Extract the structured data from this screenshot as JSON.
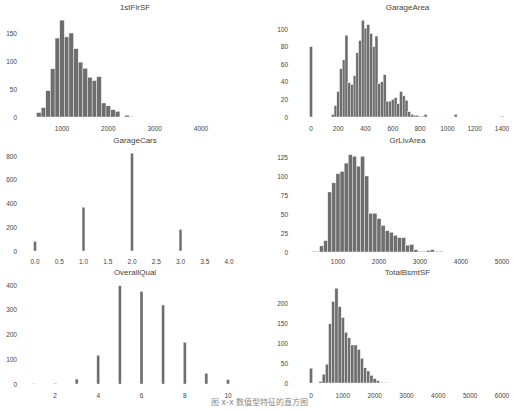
{
  "figure": {
    "caption": "图 x-x 数值型特征的直方图",
    "bar_color": "#6e6e6e",
    "bar_edge_color": "#ffffff",
    "text_color": "#444444",
    "grid": false
  },
  "chart_data": [
    {
      "type": "bar",
      "title": "1stFlrSF",
      "xlabel": "",
      "ylabel": "",
      "xticks": [
        1000,
        2000,
        3000,
        4000
      ],
      "yticks": [
        0,
        50,
        100,
        150
      ],
      "xlim": [
        300,
        4700
      ],
      "ylim": [
        0,
        175
      ],
      "bin_width": 100,
      "bins": [
        500,
        600,
        700,
        800,
        900,
        1000,
        1100,
        1200,
        1300,
        1400,
        1500,
        1600,
        1700,
        1800,
        1900,
        2000,
        2100,
        2200,
        2400,
        2500
      ],
      "values": [
        8,
        17,
        47,
        86,
        141,
        173,
        143,
        150,
        122,
        98,
        87,
        71,
        65,
        72,
        25,
        20,
        13,
        10,
        3,
        1
      ],
      "px": {
        "x0": 30,
        "x1": 240,
        "xa": 1000,
        "xa_px": 62,
        "xb": 4000,
        "xb_px": 201,
        "y0_px": 117,
        "ytop": 150,
        "ytop_px": 33,
        "title_y": 10,
        "ylab_x": 17,
        "xlab_y": 131
      }
    },
    {
      "type": "bar",
      "title": "GarageArea",
      "xlabel": "",
      "ylabel": "",
      "xticks": [
        0,
        200,
        400,
        600,
        800,
        1000,
        1200,
        1400
      ],
      "yticks": [
        0,
        20,
        40,
        60,
        80,
        100
      ],
      "xlim": [
        -50,
        1450
      ],
      "ylim": [
        0,
        112
      ],
      "bin_width": 22,
      "bins": [
        0,
        160,
        180,
        200,
        220,
        240,
        260,
        280,
        300,
        320,
        340,
        360,
        380,
        400,
        420,
        440,
        460,
        480,
        500,
        520,
        540,
        560,
        580,
        600,
        620,
        640,
        660,
        680,
        700,
        720,
        740,
        760,
        780,
        800,
        820,
        840,
        860,
        880,
        900,
        920,
        940,
        960,
        980,
        1000,
        1020,
        1060,
        1400
      ],
      "values": [
        80,
        3,
        13,
        29,
        55,
        65,
        93,
        39,
        37,
        47,
        73,
        87,
        110,
        101,
        105,
        95,
        80,
        92,
        38,
        40,
        48,
        18,
        18,
        20,
        22,
        15,
        29,
        24,
        19,
        6,
        3,
        2,
        2,
        1,
        1,
        3,
        0,
        0,
        0,
        0,
        0,
        0,
        0,
        0,
        0,
        3,
        1
      ],
      "px": {
        "x0": 300,
        "x1": 515,
        "xa": 0,
        "xa_px": 311,
        "xb": 1400,
        "xb_px": 502,
        "y0_px": 117,
        "ytop": 100,
        "ytop_px": 29,
        "title_y": 10,
        "ylab_x": 288,
        "xlab_y": 131
      }
    },
    {
      "type": "bar",
      "title": "GarageCars",
      "xlabel": "",
      "ylabel": "",
      "xticks": [
        0.0,
        0.5,
        1.0,
        1.5,
        2.0,
        2.5,
        3.0,
        3.5,
        4.0
      ],
      "xtick_labels": [
        "0.0",
        "0.5",
        "1.0",
        "1.5",
        "2.0",
        "2.5",
        "3.0",
        "3.5",
        "4.0"
      ],
      "yticks": [
        0,
        200,
        400,
        600,
        800
      ],
      "xlim": [
        -0.2,
        4.2
      ],
      "ylim": [
        0,
        830
      ],
      "bin_width": 0.06,
      "bins": [
        0,
        1,
        2,
        3
      ],
      "values": [
        81,
        369,
        824,
        181
      ],
      "px": {
        "x0": 30,
        "x1": 240,
        "xa": 0,
        "xa_px": 35,
        "xb": 4,
        "xb_px": 229,
        "y0_px": 251,
        "ytop": 800,
        "ytop_px": 156,
        "title_y": 143,
        "ylab_x": 17,
        "xlab_y": 264
      }
    },
    {
      "type": "bar",
      "title": "GrLivArea",
      "xlabel": "",
      "ylabel": "",
      "xticks": [
        1000,
        2000,
        3000,
        4000,
        5000
      ],
      "yticks": [
        0,
        25,
        50,
        75,
        100,
        125
      ],
      "xlim": [
        300,
        5700
      ],
      "ylim": [
        0,
        130
      ],
      "bin_width": 100,
      "bins": [
        400,
        500,
        600,
        700,
        800,
        900,
        1000,
        1100,
        1200,
        1300,
        1400,
        1500,
        1600,
        1700,
        1800,
        1900,
        2000,
        2100,
        2200,
        2300,
        2400,
        2500,
        2600,
        2700,
        2800,
        2900,
        3000,
        3100,
        3200,
        3300,
        3400,
        3500
      ],
      "values": [
        1,
        1,
        8,
        15,
        79,
        91,
        103,
        106,
        117,
        128,
        126,
        113,
        126,
        100,
        51,
        51,
        44,
        35,
        28,
        26,
        22,
        19,
        19,
        9,
        10,
        3,
        1,
        1,
        2,
        3,
        1,
        1
      ],
      "px": {
        "x0": 300,
        "x1": 515,
        "xa": 1000,
        "xa_px": 338,
        "xb": 5000,
        "xb_px": 502,
        "y0_px": 252,
        "ytop": 125,
        "ytop_px": 157,
        "title_y": 143,
        "ylab_x": 288,
        "xlab_y": 264
      }
    },
    {
      "type": "bar",
      "title": "OverallQual",
      "xlabel": "",
      "ylabel": "",
      "xticks": [
        2,
        4,
        6,
        8,
        10
      ],
      "yticks": [
        0,
        100,
        200,
        300,
        400
      ],
      "xlim": [
        0.5,
        10.5
      ],
      "ylim": [
        0,
        410
      ],
      "bin_width": 0.14,
      "bins": [
        1,
        2,
        3,
        4,
        5,
        6,
        7,
        8,
        9,
        10
      ],
      "values": [
        2,
        3,
        20,
        116,
        397,
        374,
        319,
        168,
        43,
        18
      ],
      "px": {
        "x0": 30,
        "x1": 240,
        "xa": 2,
        "xa_px": 55,
        "xb": 10,
        "xb_px": 228,
        "y0_px": 384,
        "ytop": 400,
        "ytop_px": 285,
        "title_y": 275,
        "ylab_x": 17,
        "xlab_y": 398
      }
    },
    {
      "type": "bar",
      "title": "TotalBsmtSF",
      "xlabel": "",
      "ylabel": "",
      "xticks": [
        0,
        1000,
        2000,
        3000,
        4000,
        5000,
        6000
      ],
      "yticks": [
        0,
        50,
        100,
        150,
        200
      ],
      "xlim": [
        -300,
        6300
      ],
      "ylim": [
        0,
        240
      ],
      "bin_width": 100,
      "bins": [
        0,
        300,
        400,
        500,
        600,
        700,
        800,
        900,
        1000,
        1100,
        1200,
        1300,
        1400,
        1500,
        1600,
        1700,
        1800,
        1900,
        2000,
        2100,
        2200,
        2300,
        2400
      ],
      "values": [
        37,
        4,
        22,
        47,
        148,
        204,
        237,
        191,
        164,
        127,
        113,
        95,
        95,
        84,
        62,
        38,
        30,
        19,
        11,
        6,
        2,
        1,
        1
      ],
      "px": {
        "x0": 300,
        "x1": 515,
        "xa": 0,
        "xa_px": 311,
        "xb": 6000,
        "xb_px": 502,
        "y0_px": 383,
        "ytop": 200,
        "ytop_px": 303,
        "title_y": 275,
        "ylab_x": 288,
        "xlab_y": 398
      }
    }
  ]
}
